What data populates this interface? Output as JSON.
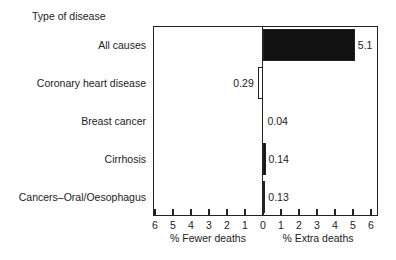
{
  "chart_data": {
    "type": "bar",
    "orientation": "horizontal",
    "title": "Type of disease",
    "categories": [
      "All causes",
      "Coronary heart disease",
      "Breast cancer",
      "Cirrhosis",
      "Cancers–Oral/Oesophagus"
    ],
    "values": [
      5.1,
      -0.29,
      0.04,
      0.14,
      0.13
    ],
    "value_labels": [
      "5.1",
      "0.29",
      "0.04",
      "0.14",
      "0.13"
    ],
    "directions": [
      "extra",
      "fewer",
      "extra",
      "extra",
      "extra"
    ],
    "bar_fills": [
      "#111111",
      "#ffffff",
      "#111111",
      "#111111",
      "#111111"
    ],
    "xlabel_left": "% Fewer deaths",
    "xlabel_right": "% Extra deaths",
    "xlim": [
      -6,
      6
    ],
    "xticks_left": [
      "6",
      "5",
      "4",
      "3",
      "2",
      "1"
    ],
    "xtick_zero": "0",
    "xticks_right": [
      "1",
      "2",
      "3",
      "4",
      "5",
      "6"
    ],
    "grid": false,
    "legend": null
  }
}
